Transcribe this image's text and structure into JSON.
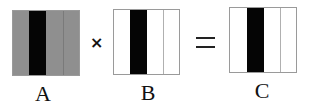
{
  "diagram": {
    "operands": [
      {
        "label": "A",
        "fill": "#8f8f8f",
        "stripe_color": "#050505",
        "divider_color": "#7a7a7a"
      },
      {
        "label": "B",
        "fill": "#ffffff",
        "stripe_color": "#050505",
        "divider_color": "#b0b0b0"
      },
      {
        "label": "C",
        "fill": "#ffffff",
        "stripe_color": "#050505",
        "divider_color": "#b0b0b0"
      }
    ],
    "operators": {
      "multiply": "×",
      "equals": "="
    }
  }
}
